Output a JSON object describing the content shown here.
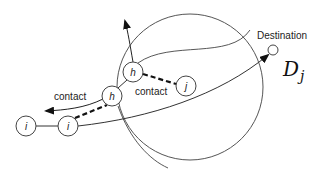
{
  "diagram": {
    "type": "network-contact-routing",
    "nodes": [
      {
        "id": "i_left",
        "label": "i"
      },
      {
        "id": "i_right",
        "label": "i"
      },
      {
        "id": "h_lower",
        "label": "h"
      },
      {
        "id": "h_upper",
        "label": "h"
      },
      {
        "id": "j",
        "label": "j"
      },
      {
        "id": "destination",
        "label": "Destination"
      }
    ],
    "edges": [
      {
        "from": "i_left",
        "to": "i_right",
        "style": "solid"
      },
      {
        "from": "i_right",
        "to": "h_lower",
        "style": "dashed",
        "label": "contact"
      },
      {
        "from": "h_lower",
        "to": "h_upper",
        "style": "solid"
      },
      {
        "from": "h_upper",
        "to": "j",
        "style": "dashed",
        "label": "contact"
      },
      {
        "from": "i_right",
        "to": "destination",
        "style": "arrow"
      }
    ],
    "labels": {
      "destination": "Destination",
      "contact_lower": "contact",
      "contact_upper": "contact",
      "region_symbol": "D",
      "region_subscript": "j"
    },
    "colors": {
      "stroke": "#333333",
      "background": "#ffffff"
    }
  }
}
